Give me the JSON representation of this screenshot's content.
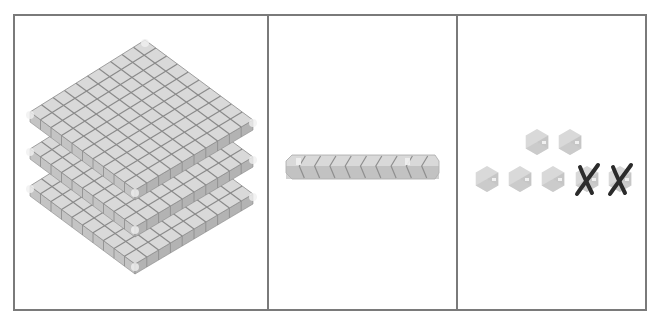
{
  "figure": {
    "panels": [
      {
        "id": "hundreds",
        "label": "Hundreds",
        "block_type": "flat",
        "count": 3,
        "grid": 10
      },
      {
        "id": "tens",
        "label": "Tens",
        "block_type": "rod",
        "count": 1,
        "units_per_rod": 10
      },
      {
        "id": "ones",
        "label": "Ones",
        "block_type": "unit-cube",
        "count": 7,
        "crossed_out": 2,
        "remaining": 5
      }
    ]
  },
  "colors": {
    "border": "#7a7a7a",
    "block_top": "#d9d9d9",
    "block_left": "#c4c4c4",
    "block_right": "#b3b3b3",
    "grid_line": "#8a8a8a",
    "highlight": "#f0f0f0",
    "cross_mark": "#2b2b2b"
  }
}
